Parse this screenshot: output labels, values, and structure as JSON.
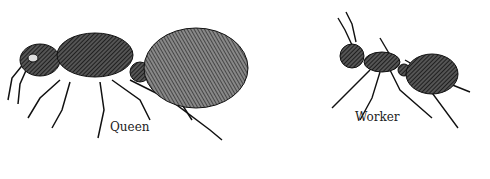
{
  "figure": {
    "labels": {
      "queen": "Queen",
      "worker": "Worker"
    }
  }
}
